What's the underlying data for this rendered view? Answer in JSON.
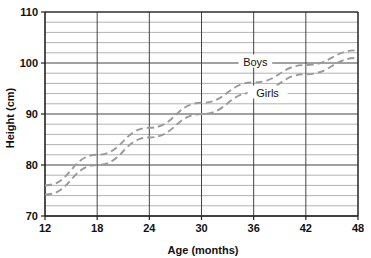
{
  "chart_data": {
    "type": "line",
    "title": "",
    "xlabel": "Age (months)",
    "ylabel": "Height (cm)",
    "xlim": [
      12,
      48
    ],
    "ylim": [
      70,
      110
    ],
    "xticks": [
      12,
      18,
      24,
      30,
      36,
      42,
      48
    ],
    "yticks": [
      70,
      80,
      90,
      100,
      110
    ],
    "xtick_labels": [
      "12",
      "18",
      "24",
      "30",
      "36",
      "42",
      "48"
    ],
    "ytick_labels": [
      "70",
      "80",
      "90",
      "100",
      "110"
    ],
    "grid": {
      "horizontal_minor_step": 2,
      "vertical_step": 6,
      "on": true
    },
    "legend": {
      "position": "inline-annotations",
      "entries": [
        "Boys",
        "Girls"
      ]
    },
    "x": [
      12,
      18,
      24,
      30,
      36,
      42,
      48
    ],
    "series": [
      {
        "name": "Boys",
        "label": "Boys",
        "style": "dashed",
        "color": "#9a9a9a",
        "values": [
          76.0,
          82.0,
          87.3,
          92.2,
          96.2,
          99.6,
          102.5
        ]
      },
      {
        "name": "Girls",
        "label": "Girls",
        "style": "dashed",
        "color": "#9a9a9a",
        "values": [
          74.2,
          80.0,
          85.4,
          90.0,
          94.2,
          97.8,
          101.0
        ]
      }
    ],
    "annotations": [
      {
        "text": "Boys",
        "x": 36.2,
        "y": 100.2,
        "leader": "both"
      },
      {
        "text": "Girls",
        "x": 37.6,
        "y": 94.1,
        "leader": "both"
      }
    ],
    "colors": {
      "axis": "#222222",
      "major_grid": "#444444",
      "minor_grid": "#aaaaaa",
      "series": "#9a9a9a",
      "background": "#ffffff",
      "text": "#111111"
    }
  }
}
